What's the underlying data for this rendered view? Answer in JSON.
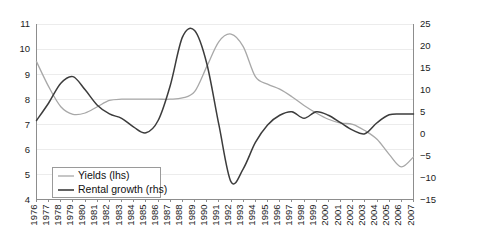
{
  "chart_data": {
    "type": "line",
    "title": "",
    "subtitle": "",
    "xlabel": "",
    "ylabel": "",
    "grid": true,
    "legend_position": "bottom-left",
    "x": [
      1976,
      1977,
      1978,
      1979,
      1980,
      1981,
      1982,
      1983,
      1984,
      1985,
      1986,
      1987,
      1988,
      1989,
      1990,
      1991,
      1992,
      1993,
      1994,
      1995,
      1996,
      1997,
      1998,
      1999,
      2000,
      2001,
      2002,
      2003,
      2004,
      2005,
      2006,
      2007
    ],
    "categories": [
      "1976",
      "1977",
      "1978",
      "1979",
      "1980",
      "1981",
      "1982",
      "1983",
      "1984",
      "1985",
      "1986",
      "1987",
      "1988",
      "1989",
      "1990",
      "1991",
      "1992",
      "1993",
      "1994",
      "1995",
      "1996",
      "1997",
      "1998",
      "1999",
      "2000",
      "2001",
      "2002",
      "2003",
      "2004",
      "2005",
      "2006",
      "2007"
    ],
    "axes": {
      "left": {
        "label": "",
        "ticks": [
          4,
          5,
          6,
          7,
          8,
          9,
          10,
          11
        ],
        "ticklabels": [
          "4",
          "5",
          "6",
          "7",
          "8",
          "9",
          "10",
          "11"
        ],
        "ylim": [
          4,
          11
        ]
      },
      "right": {
        "label": "",
        "ticks": [
          -15,
          -10,
          -5,
          0,
          5,
          10,
          15,
          20,
          25
        ],
        "ticklabels": [
          "−15",
          "−10",
          "−5",
          "0",
          "5",
          "10",
          "15",
          "20",
          "25"
        ],
        "ylim": [
          -15,
          25
        ]
      }
    },
    "series": [
      {
        "name": "Yields (lhs)",
        "axis": "left",
        "color": "#a8a8a8",
        "width": 1.3,
        "values": [
          9.5,
          8.5,
          7.7,
          7.4,
          7.45,
          7.7,
          7.95,
          8.0,
          8.0,
          8.0,
          8.0,
          8.0,
          8.05,
          8.3,
          9.3,
          10.3,
          10.6,
          10.1,
          8.9,
          8.6,
          8.4,
          8.1,
          7.75,
          7.45,
          7.2,
          7.05,
          7.0,
          6.75,
          6.4,
          5.8,
          5.3,
          5.7
        ]
      },
      {
        "name": "Rental growth (rhs)",
        "axis": "right",
        "color": "#3c3c3c",
        "width": 1.5,
        "values": [
          3.0,
          7.0,
          11.5,
          13.0,
          10.0,
          6.5,
          4.5,
          3.5,
          1.5,
          0.2,
          3.0,
          11.0,
          22.0,
          23.5,
          16.0,
          2.0,
          -11.0,
          -8.0,
          -2.0,
          2.0,
          4.2,
          5.0,
          3.5,
          5.0,
          4.2,
          2.5,
          0.8,
          0.0,
          2.5,
          4.3,
          4.5,
          4.5
        ]
      }
    ]
  },
  "legend": {
    "items": [
      {
        "label": "Yields (lhs)",
        "color": "#a8a8a8"
      },
      {
        "label": "Rental growth (rhs)",
        "color": "#3c3c3c"
      }
    ]
  },
  "colors": {
    "yields": "#a8a8a8",
    "rental_growth": "#3c3c3c",
    "axis": "#8d8d8d",
    "grid": "#ececec",
    "text": "#1c1c1c",
    "background": "#ffffff"
  }
}
